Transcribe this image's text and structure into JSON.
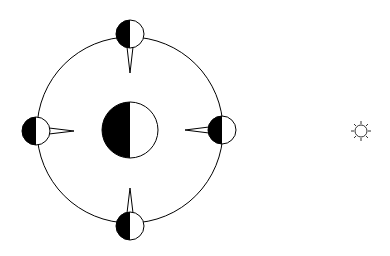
{
  "diagram": {
    "colors": {
      "stroke": "#000000",
      "fill_dark": "#000000",
      "fill_light": "#ffffff",
      "background": "#ffffff"
    },
    "orbit": {
      "cx": 130,
      "cy": 130,
      "r": 93
    },
    "planet": {
      "cx": 130,
      "cy": 130,
      "r": 28,
      "dark_side": "left"
    },
    "moons": [
      {
        "position": "top",
        "cx": 130,
        "cy": 34,
        "r": 14,
        "dark_side": "left",
        "spike": "down"
      },
      {
        "position": "left",
        "cx": 36,
        "cy": 131,
        "r": 14,
        "dark_side": "left",
        "spike": "right"
      },
      {
        "position": "right",
        "cx": 222,
        "cy": 130,
        "r": 14,
        "dark_side": "left",
        "spike": "left"
      },
      {
        "position": "bottom",
        "cx": 130,
        "cy": 226,
        "r": 14,
        "dark_side": "left",
        "spike": "up"
      }
    ],
    "sun": {
      "cx": 361,
      "cy": 131,
      "r": 6,
      "icon": "sun-icon"
    }
  }
}
